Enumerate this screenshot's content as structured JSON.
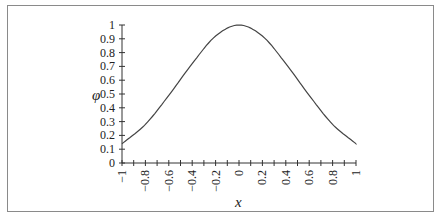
{
  "chart_data": {
    "type": "line",
    "title": "",
    "xlabel": "x",
    "ylabel": "φ",
    "xlim": [
      -1,
      1
    ],
    "ylim": [
      0,
      1
    ],
    "grid": false,
    "legend": null,
    "x_ticks": [
      "-1",
      "-0.8",
      "-0.6",
      "-0.4",
      "-0.2",
      "0",
      "0.2",
      "0.4",
      "0.6",
      "0.8",
      "1"
    ],
    "y_ticks": [
      "0",
      "0.1",
      "0.2",
      "0.3",
      "0.4",
      "0.5",
      "0.6",
      "0.7",
      "0.8",
      "0.9",
      "1"
    ],
    "series": [
      {
        "name": "φ(x)",
        "color": "#444444",
        "x": [
          -1,
          -0.8,
          -0.6,
          -0.4,
          -0.2,
          0,
          0.2,
          0.4,
          0.6,
          0.8,
          1
        ],
        "y": [
          0.14,
          0.28,
          0.49,
          0.72,
          0.92,
          1.0,
          0.92,
          0.72,
          0.49,
          0.28,
          0.14
        ]
      }
    ]
  },
  "labels": {
    "x_axis": "x",
    "y_axis": "φ"
  }
}
